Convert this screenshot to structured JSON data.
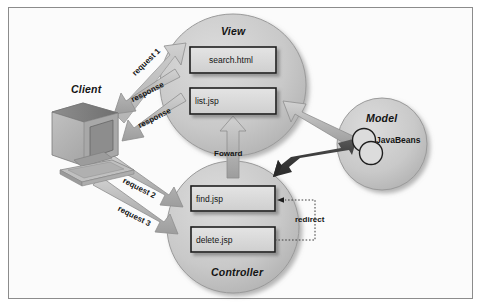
{
  "figure": {
    "kind": "mvc-architecture-diagram",
    "background_color": "#fbfbfb",
    "border_color": "#8c8c8c",
    "nodes": [
      {
        "id": "client",
        "label": "Client",
        "shape": "computer-illustration"
      },
      {
        "id": "view",
        "label": "View",
        "shape": "circle",
        "items": [
          "search.html",
          "list.jsp"
        ]
      },
      {
        "id": "model",
        "label": "Model",
        "shape": "circle",
        "items": [
          "JavaBeans"
        ]
      },
      {
        "id": "controller",
        "label": "Controller",
        "shape": "circle",
        "items": [
          "find.jsp",
          "delete.jsp"
        ]
      }
    ],
    "edges": [
      {
        "id": "request-1",
        "label": "request 1",
        "from": "client",
        "to": "view",
        "style": "block-arrow-light"
      },
      {
        "id": "response-1",
        "label": "response",
        "from": "view",
        "to": "client",
        "style": "block-arrow-light"
      },
      {
        "id": "response-2",
        "label": "response",
        "from": "view",
        "to": "client",
        "style": "block-arrow-light"
      },
      {
        "id": "request-2",
        "label": "request 2",
        "from": "client",
        "to": "controller",
        "style": "block-arrow-light"
      },
      {
        "id": "request-3",
        "label": "request 3",
        "from": "client",
        "to": "controller",
        "style": "block-arrow-light"
      },
      {
        "id": "foward",
        "label": "Foward",
        "from": "controller",
        "to": "view",
        "style": "block-arrow-light"
      },
      {
        "id": "model-to-view",
        "label": "",
        "from": "model",
        "to": "view",
        "style": "block-arrow-light"
      },
      {
        "id": "controller-model",
        "label": "",
        "from": "controller",
        "to": "model",
        "style": "block-arrow-dark-bidirectional"
      },
      {
        "id": "redirect",
        "label": "redirect",
        "from": "delete.jsp",
        "to": "find.jsp",
        "style": "dotted-line-arrow"
      }
    ],
    "view_items": {
      "item_1": "search.html",
      "item_2": "list.jsp"
    },
    "controller_items": {
      "item_1": "find.jsp",
      "item_2": "delete.jsp"
    },
    "model_items": {
      "item_1": "JavaBeans"
    },
    "labels": {
      "client": "Client",
      "view": "View",
      "model": "Model",
      "controller": "Controller",
      "request_1": "request 1",
      "response_a": "response",
      "response_b": "response",
      "request_2": "request 2",
      "request_3": "request 3",
      "foward": "Foward",
      "redirect": "redirect"
    },
    "colors": {
      "circle_fill": "#c6c6c6",
      "box_fill": "#d7d7d7",
      "arrow_light": "#b5b5b5",
      "arrow_dark": "#3a3a3a",
      "text": "#141414"
    }
  }
}
